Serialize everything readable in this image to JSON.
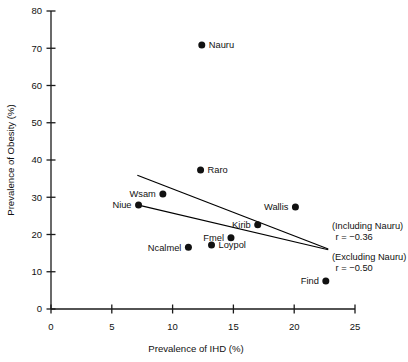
{
  "chart_data": {
    "type": "scatter",
    "title": "",
    "xlabel": "Prevalence of IHD (%)",
    "ylabel": "Prevalence of Obesity (%)",
    "xlim": [
      0,
      25
    ],
    "ylim": [
      0,
      80
    ],
    "xticks": [
      0,
      5,
      10,
      15,
      20,
      25
    ],
    "yticks": [
      0,
      10,
      20,
      30,
      40,
      50,
      60,
      70,
      80
    ],
    "xtick_labels": [
      "0",
      "5",
      "10",
      "15",
      "20",
      "25"
    ],
    "ytick_labels": [
      "0",
      "10",
      "20",
      "30",
      "40",
      "50",
      "60",
      "70",
      "80"
    ],
    "grid": false,
    "legend": "none",
    "points": [
      {
        "label": "Nauru",
        "x": 12.4,
        "y": 70.9,
        "label_side": "right"
      },
      {
        "label": "Raro",
        "x": 12.3,
        "y": 37.3,
        "label_side": "right"
      },
      {
        "label": "Wsam",
        "x": 9.2,
        "y": 30.9,
        "label_side": "left"
      },
      {
        "label": "Niue",
        "x": 7.2,
        "y": 27.9,
        "label_side": "left"
      },
      {
        "label": "Wallis",
        "x": 20.1,
        "y": 27.4,
        "label_side": "left"
      },
      {
        "label": "Kirib",
        "x": 17.0,
        "y": 22.6,
        "label_side": "left"
      },
      {
        "label": "Fmel",
        "x": 14.8,
        "y": 19.1,
        "label_side": "left"
      },
      {
        "label": "Loypol",
        "x": 13.2,
        "y": 17.2,
        "label_side": "right"
      },
      {
        "label": "Ncalmel",
        "x": 11.3,
        "y": 16.6,
        "label_side": "left"
      },
      {
        "label": "Find",
        "x": 22.6,
        "y": 7.5,
        "label_side": "left"
      }
    ],
    "trend_lines": [
      {
        "name": "including-nauru",
        "annotation_group": "(Including Nauru)",
        "annotation_r": "r = −0.36",
        "r": -0.36,
        "x_start": 7.1,
        "y_start": 35.9,
        "x_end": 22.8,
        "y_end": 16.1
      },
      {
        "name": "excluding-nauru",
        "annotation_group": "(Excluding Nauru)",
        "annotation_r": "r = −0.50",
        "r": -0.5,
        "x_start": 7.2,
        "y_start": 27.9,
        "x_end": 22.8,
        "y_end": 15.9
      }
    ],
    "annotations": [
      {
        "text": "(Including Nauru)",
        "x": 23.1,
        "y": 21.5
      },
      {
        "text": "r = −0.36",
        "x": 23.4,
        "y": 18.6
      },
      {
        "text": "(Excluding Nauru)",
        "x": 23.1,
        "y": 13.2
      },
      {
        "text": "r = −0.50",
        "x": 23.4,
        "y": 10.3
      }
    ],
    "colors": {
      "marker": "#111111",
      "axis": "#1a1a1a",
      "line": "#000000",
      "background": "#ffffff"
    }
  }
}
